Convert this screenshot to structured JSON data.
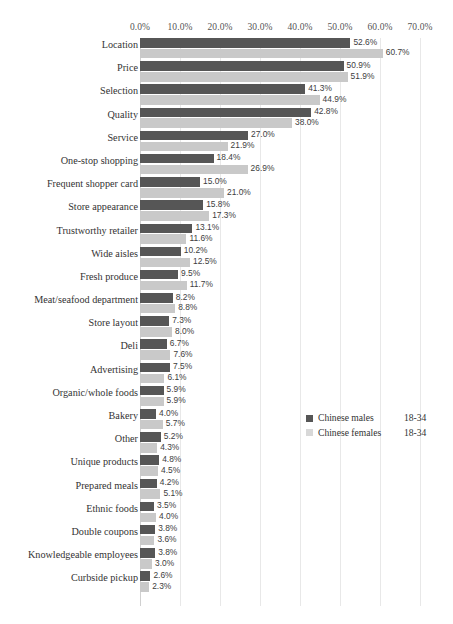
{
  "chart_data": {
    "type": "bar",
    "orientation": "horizontal",
    "title": "",
    "xlabel": "",
    "ylabel": "",
    "xlim": [
      0,
      70
    ],
    "grid": true,
    "legend_position": "middle-right",
    "tick_labels": [
      "0.0%",
      "10.0%",
      "20.0%",
      "30.0%",
      "40.0%",
      "50.0%",
      "60.0%",
      "70.0%"
    ],
    "tick_values": [
      0,
      10,
      20,
      30,
      40,
      50,
      60,
      70
    ],
    "categories": [
      "Location",
      "Price",
      "Selection",
      "Quality",
      "Service",
      "One-stop shopping",
      "Frequent shopper card",
      "Store appearance",
      "Trustworthy retailer",
      "Wide aisles",
      "Fresh produce",
      "Meat/seafood department",
      "Store layout",
      "Deli",
      "Advertising",
      "Organic/whole foods",
      "Bakery",
      "Other",
      "Unique products",
      "Prepared meals",
      "Ethnic foods",
      "Double coupons",
      "Knowledgeable employees",
      "Curbside pickup"
    ],
    "series": [
      {
        "name": "Chinese males",
        "age": "18-34",
        "color": "#565656",
        "values": [
          52.6,
          50.9,
          41.3,
          42.8,
          27.0,
          18.4,
          15.0,
          15.8,
          13.1,
          10.2,
          9.5,
          8.2,
          7.3,
          6.7,
          7.5,
          5.9,
          4.0,
          5.2,
          4.8,
          4.2,
          3.5,
          3.8,
          3.8,
          2.6
        ],
        "labels": [
          "52.6%",
          "50.9%",
          "41.3%",
          "42.8%",
          "27.0%",
          "18.4%",
          "15.0%",
          "15.8%",
          "13.1%",
          "10.2%",
          "9.5%",
          "8.2%",
          "7.3%",
          "6.7%",
          "7.5%",
          "5.9%",
          "4.0%",
          "5.2%",
          "4.8%",
          "4.2%",
          "3.5%",
          "3.8%",
          "3.8%",
          "2.6%"
        ]
      },
      {
        "name": "Chinese females",
        "age": "18-34",
        "color": "#c9c9c9",
        "values": [
          60.7,
          51.9,
          44.9,
          38.0,
          21.9,
          26.9,
          21.0,
          17.3,
          11.6,
          12.5,
          11.7,
          8.8,
          8.0,
          7.6,
          6.1,
          5.9,
          5.7,
          4.3,
          4.5,
          5.1,
          4.0,
          3.6,
          3.0,
          2.3
        ],
        "labels": [
          "60.7%",
          "51.9%",
          "44.9%",
          "38.0%",
          "21.9%",
          "26.9%",
          "21.0%",
          "17.3%",
          "11.6%",
          "12.5%",
          "11.7%",
          "8.8%",
          "8.0%",
          "7.6%",
          "6.1%",
          "5.9%",
          "5.7%",
          "4.3%",
          "4.5%",
          "5.1%",
          "4.0%",
          "3.6%",
          "3.0%",
          "2.3%"
        ]
      }
    ]
  },
  "legend": {
    "items": [
      {
        "name": "Chinese males",
        "age": "18-34",
        "swatch": "male"
      },
      {
        "name": "Chinese females",
        "age": "18-34",
        "swatch": "female"
      }
    ]
  }
}
